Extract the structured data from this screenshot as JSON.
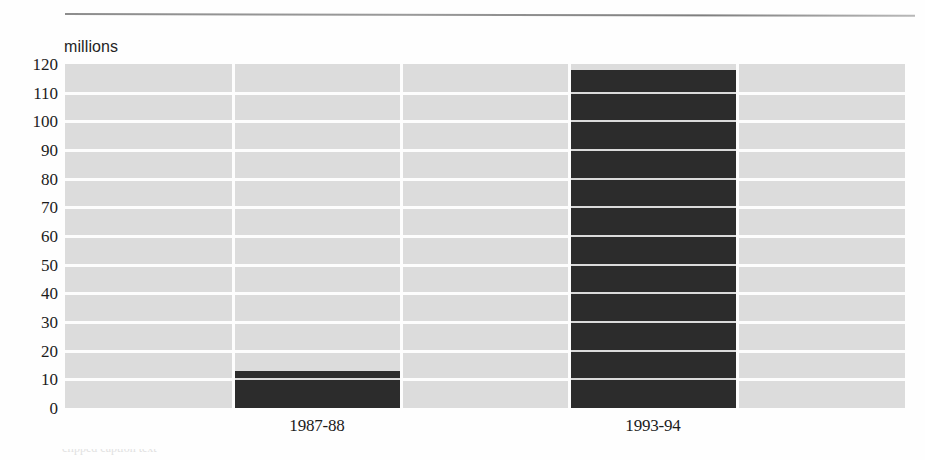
{
  "chart_data": {
    "type": "bar",
    "title": "",
    "subtitle": "",
    "unit_label": "millions",
    "xlabel": "",
    "ylabel": "millions",
    "categories": [
      "1987-88",
      "1993-94"
    ],
    "values": [
      13,
      118
    ],
    "series": [
      {
        "name": "value",
        "values": [
          13,
          118
        ]
      }
    ],
    "ylim": [
      0,
      120
    ],
    "ytick_step": 10,
    "yticks": [
      "120",
      "110",
      "100",
      "90",
      "80",
      "70",
      "60",
      "50",
      "40",
      "30",
      "20",
      "10",
      "0"
    ],
    "grid": true,
    "grid_orientation": "horizontal",
    "legend": "none",
    "bar_color": "#2c2c2c",
    "plot_background": "#dcdcdc",
    "gridline_color": "#fdfdfd",
    "column_slots": 5,
    "bar_slot_indices": [
      1,
      3
    ]
  },
  "figure": {
    "top_rule": "horizontal-rule",
    "footer_text_partial": "clipped caption text"
  }
}
